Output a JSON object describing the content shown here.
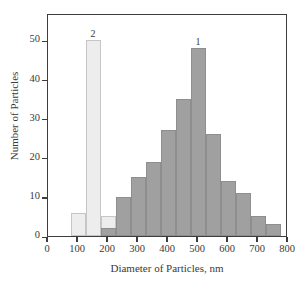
{
  "chart_data": {
    "type": "bar",
    "title": "",
    "subtitle": "",
    "xlabel": "Diameter of Particles, nm",
    "ylabel": "Number of Particles",
    "xlim": [
      0,
      800
    ],
    "ylim": [
      0,
      57
    ],
    "xticks": [
      0,
      100,
      200,
      300,
      400,
      500,
      600,
      700,
      800
    ],
    "yticks": [
      0,
      10,
      20,
      30,
      40,
      50
    ],
    "grid": false,
    "legend_position": "inline-annotations",
    "bin_width": 50,
    "annotations": [
      {
        "label": "1",
        "x": 500,
        "y": 48,
        "series": "1"
      },
      {
        "label": "2",
        "x": 150,
        "y": 50,
        "series": "2"
      }
    ],
    "series": [
      {
        "name": "1",
        "color": "#a0a0a0",
        "bins": [
          {
            "center": 200,
            "value": 2
          },
          {
            "center": 250,
            "value": 10
          },
          {
            "center": 300,
            "value": 15
          },
          {
            "center": 350,
            "value": 19
          },
          {
            "center": 400,
            "value": 27
          },
          {
            "center": 450,
            "value": 35
          },
          {
            "center": 500,
            "value": 48
          },
          {
            "center": 550,
            "value": 26
          },
          {
            "center": 600,
            "value": 14
          },
          {
            "center": 650,
            "value": 11
          },
          {
            "center": 700,
            "value": 5
          },
          {
            "center": 750,
            "value": 3
          }
        ]
      },
      {
        "name": "2",
        "color": "#ededed",
        "bins": [
          {
            "center": 100,
            "value": 6
          },
          {
            "center": 150,
            "value": 50
          },
          {
            "center": 200,
            "value": 5
          }
        ]
      }
    ]
  },
  "axes": {
    "y_title": "Number of Particles",
    "x_title": "Diameter of Particles, nm",
    "y_tick_labels": [
      "0",
      "10",
      "20",
      "30",
      "40",
      "50"
    ],
    "x_tick_labels": [
      "0",
      "100",
      "200",
      "300",
      "400",
      "500",
      "600",
      "700",
      "800"
    ]
  },
  "colors": {
    "series_1": "#a0a0a0",
    "series_2": "#ededed",
    "axis": "#3d3d3d",
    "text": "#3a3a3a",
    "background": "#ffffff"
  }
}
